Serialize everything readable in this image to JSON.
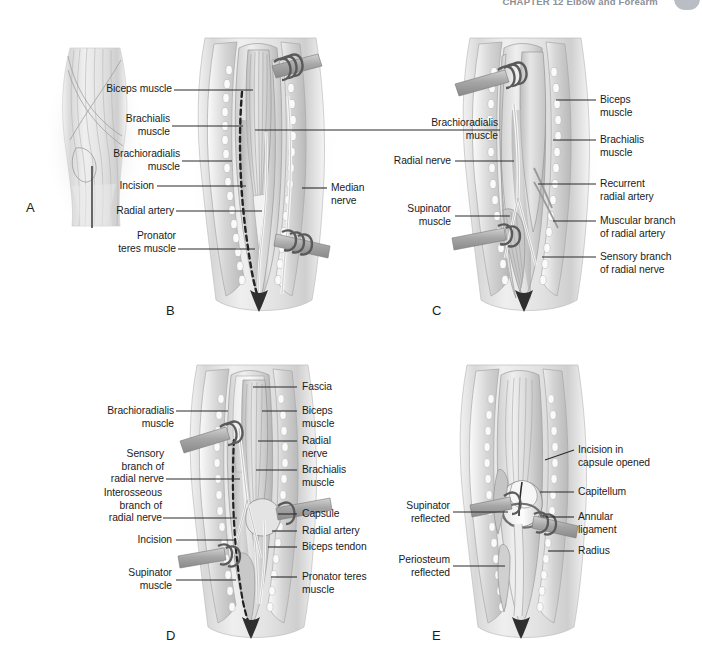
{
  "header": {
    "running_head": "CHAPTER 12  Elbow and Forearm"
  },
  "panels": [
    {
      "letter": "A",
      "caption": "",
      "labels_left": [],
      "labels_right": []
    },
    {
      "letter": "B",
      "labels_left": [
        {
          "text": "Biceps muscle"
        },
        {
          "text": "Brachialis\nmuscle"
        },
        {
          "text": "Brachioradialis\nmuscle"
        },
        {
          "text": "Incision"
        },
        {
          "text": "Radial artery"
        },
        {
          "text": "Pronator\nteres muscle"
        }
      ],
      "labels_right": [
        {
          "text": "Median\nnerve"
        }
      ]
    },
    {
      "letter": "C",
      "labels_left": [
        {
          "text": "Brachioradialis\nmuscle"
        },
        {
          "text": "Radial nerve"
        },
        {
          "text": "Supinator\nmuscle"
        }
      ],
      "labels_right": [
        {
          "text": "Biceps\nmuscle"
        },
        {
          "text": "Brachialis\nmuscle"
        },
        {
          "text": "Recurrent\nradial artery"
        },
        {
          "text": "Muscular branch\nof radial artery"
        },
        {
          "text": "Sensory branch\nof radial nerve"
        }
      ]
    },
    {
      "letter": "D",
      "labels_left": [
        {
          "text": "Brachioradialis\nmuscle"
        },
        {
          "text": "Sensory\nbranch of\nradial nerve"
        },
        {
          "text": "Interosseous\nbranch of\nradial nerve"
        },
        {
          "text": "Incision"
        },
        {
          "text": "Supinator\nmuscle"
        }
      ],
      "labels_right": [
        {
          "text": "Fascia"
        },
        {
          "text": "Biceps\nmuscle"
        },
        {
          "text": "Radial\nnerve"
        },
        {
          "text": "Brachialis\nmuscle"
        },
        {
          "text": "Capsule"
        },
        {
          "text": "Radial artery"
        },
        {
          "text": "Biceps tendon"
        },
        {
          "text": "Pronator teres\nmuscle"
        }
      ]
    },
    {
      "letter": "E",
      "labels_left": [
        {
          "text": "Supinator\nreflected"
        },
        {
          "text": "Periosteum\nreflected"
        }
      ],
      "labels_right": [
        {
          "text": "Incision in\ncapsule opened"
        },
        {
          "text": "Capitellum"
        },
        {
          "text": "Annular\nligament"
        },
        {
          "text": "Radius"
        }
      ]
    }
  ],
  "colors": {
    "background": "#ffffff",
    "label_text": "#1b1b1b",
    "leader_line": "#2b2b2b",
    "incision_line": "#232323",
    "retractor": "#8a8a8a",
    "header_text": "#8b8f96",
    "page_tab": "#b9bdc4"
  }
}
